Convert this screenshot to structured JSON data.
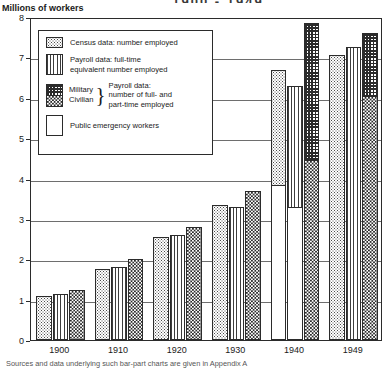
{
  "chart_data": {
    "type": "bar",
    "title": "1900 - 1949",
    "ylabel": "Millions of workers",
    "xlabel": "",
    "ylim": [
      0,
      8
    ],
    "yticks": [
      0,
      1,
      2,
      3,
      4,
      5,
      6,
      7,
      8
    ],
    "categories": [
      "1900",
      "1910",
      "1920",
      "1930",
      "1940",
      "1949"
    ],
    "grid": true,
    "legend_position": "upper-left-inset",
    "series": [
      {
        "name": "Census data: number employed",
        "key": "census",
        "values": [
          1.1,
          1.75,
          2.55,
          3.35,
          6.7,
          7.05
        ]
      },
      {
        "name": "Payroll data: full-time equivalent number employed",
        "key": "payroll_fte",
        "values": [
          1.15,
          1.8,
          2.6,
          3.3,
          6.3,
          7.25
        ]
      },
      {
        "name": "Payroll data: number of full- and part-time employed",
        "key": "payroll_total",
        "values": [
          1.25,
          2.0,
          2.8,
          3.7,
          7.85,
          7.6
        ]
      }
    ],
    "stacked_components": {
      "note": "Third bar of each group splits into Civilian (lower) and Military (upper); 1940 second bar also carries a Public emergency workers segment at its base.",
      "payroll_total_civilian": [
        1.25,
        2.0,
        2.8,
        3.7,
        4.45,
        6.05
      ],
      "payroll_total_military": [
        0.0,
        0.0,
        0.0,
        0.0,
        3.4,
        1.55
      ],
      "emergency_1940_census": 3.85,
      "emergency_1940_payroll_fte": 3.3
    },
    "annotations": []
  },
  "legend": {
    "items": [
      {
        "label": "Census data: number employed",
        "swatch": "census-swatch"
      },
      {
        "label_line1": "Payroll data: full-time",
        "label_line2": "equivalent number employed",
        "swatch": "payroll-fte-swatch"
      },
      {
        "label": "Public emergency workers",
        "swatch": "emergency-swatch"
      }
    ],
    "military_civilian": {
      "military_label": "Military",
      "civilian_label": "Civilian",
      "brace": "}",
      "desc_line1": "Payroll data:",
      "desc_line2": "number of full- and",
      "desc_line3": "part-time employed"
    }
  },
  "footer": {
    "text": "Sources and data underlying such bar-part charts are given in Appendix A"
  },
  "colors": {
    "ink": "#2b2b2b",
    "grid": "#6e6e6e",
    "paper": "#ffffff"
  }
}
